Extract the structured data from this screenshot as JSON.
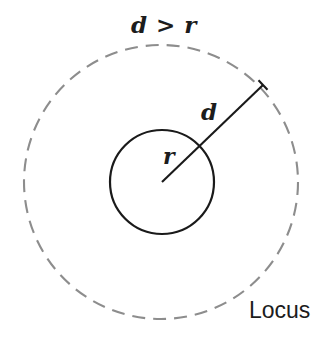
{
  "figure": {
    "background_color": "#ffffff",
    "width": 334,
    "height": 349
  },
  "labels": {
    "relation": "d > r",
    "distance": "d",
    "radius": "r",
    "locus": "Locus"
  },
  "geometry": {
    "center": {
      "x": 161,
      "y": 182
    },
    "inner_circle": {
      "name": "inner-circle",
      "radius": 52,
      "stroke_color": "#1a1a1a",
      "stroke_width": 2.2,
      "style": "solid"
    },
    "outer_circle": {
      "name": "locus-circle",
      "radius": 137,
      "stroke_color": "#8d8d8d",
      "stroke_width": 2.1,
      "style": "dashed",
      "dash_length": 13,
      "gap_length": 8
    },
    "radius_line": {
      "name": "distance-line",
      "from": {
        "x": 162,
        "y": 182
      },
      "to": {
        "x": 263,
        "y": 85
      },
      "stroke_color": "#1a1a1a",
      "stroke_width": 2.1,
      "end_tick": true,
      "tick_length": 13
    }
  },
  "chart_data": {
    "type": "diagram",
    "annotations": [
      {
        "text": "d > r",
        "role": "condition",
        "x": 161,
        "y": 28
      },
      {
        "text": "d",
        "role": "distance-label",
        "x": 209,
        "y": 113
      },
      {
        "text": "r",
        "role": "radius-label",
        "x": 170,
        "y": 158
      },
      {
        "text": "Locus",
        "role": "locus-label",
        "x": 283,
        "y": 313
      }
    ],
    "shapes": [
      {
        "kind": "circle",
        "role": "given-circle",
        "cx": 162,
        "cy": 182,
        "r": 52,
        "style": "solid",
        "color": "#1a1a1a"
      },
      {
        "kind": "circle",
        "role": "locus",
        "cx": 161,
        "cy": 182,
        "r": 137,
        "style": "dashed",
        "color": "#8d8d8d"
      },
      {
        "kind": "segment",
        "role": "distance",
        "x1": 162,
        "y1": 182,
        "x2": 263,
        "y2": 85,
        "style": "solid",
        "color": "#1a1a1a"
      }
    ]
  }
}
